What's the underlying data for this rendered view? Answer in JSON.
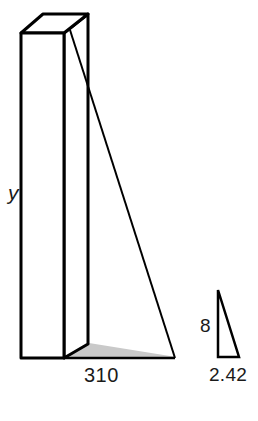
{
  "figure": {
    "colors": {
      "stroke": "#000000",
      "background": "#ffffff",
      "shadow_fill": "#c9c9c9",
      "face_fill": "#ffffff",
      "text": "#1a1a1a"
    },
    "labels": {
      "prism_height": "y",
      "prism_base": "310",
      "triangle_height": "8",
      "triangle_base": "2.42"
    },
    "shapes": {
      "prism": {
        "name": "rectangular-prism",
        "front_face": "21,33 64,33 64,358 21,358",
        "top_face": "21,33 43,14 88,14 64,33",
        "right_face": "64,33 88,14 88,358 64,358",
        "back_right_edge": "88,14 88,358"
      },
      "big_triangle": {
        "name": "large-right-triangle",
        "apex": "70,30",
        "right_angle": "64,358",
        "far_base": "173,358",
        "hypotenuse": "70,30 173,358"
      },
      "ground_shadow": {
        "name": "ground-shadow-quad",
        "points": "64,358 88,344 173,358"
      },
      "small_triangle": {
        "name": "small-right-triangle",
        "apex": "218,290",
        "right_angle": "218,357",
        "far_base": "239,357"
      }
    }
  }
}
